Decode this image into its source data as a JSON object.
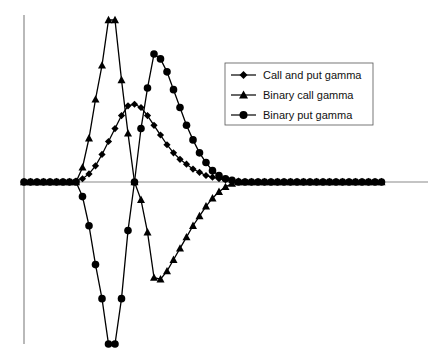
{
  "chart_data": {
    "type": "line",
    "title": "",
    "xlabel": "",
    "ylabel": "",
    "grid": false,
    "legend_position": "top-right",
    "ylim": [
      -100,
      100
    ],
    "x": [
      0,
      1,
      2,
      3,
      4,
      5,
      6,
      7,
      8,
      9,
      10,
      11,
      12,
      13,
      14,
      15,
      16,
      17,
      18,
      19,
      20,
      21,
      22,
      23,
      24,
      25,
      26,
      27,
      28,
      29,
      30,
      31,
      32,
      33,
      34,
      35,
      36,
      37,
      38,
      39,
      40,
      41,
      42,
      43,
      44,
      45,
      46,
      47,
      48,
      49,
      50,
      51,
      52,
      53,
      54,
      55
    ],
    "series": [
      {
        "name": "Call and put gamma",
        "marker": "diamond",
        "values": [
          0,
          0,
          0,
          0,
          0,
          0,
          0,
          0,
          0.5,
          2,
          5,
          10,
          17,
          25,
          33,
          41,
          47,
          48,
          46,
          41,
          35,
          29,
          23,
          18,
          14,
          11,
          8,
          6,
          4,
          3,
          2,
          1.5,
          1,
          0.5,
          0,
          0,
          0,
          0,
          0,
          0,
          0,
          0,
          0,
          0,
          0,
          0,
          0,
          0,
          0,
          0,
          0,
          0,
          0,
          0,
          0,
          0
        ]
      },
      {
        "name": "Binary call gamma",
        "marker": "triangle",
        "values": [
          0,
          0,
          0,
          0,
          0,
          0,
          0,
          0,
          0,
          9,
          27,
          51,
          72,
          100,
          100,
          63,
          30,
          0,
          -11,
          -31,
          -59,
          -60,
          -55,
          -48,
          -41,
          -34,
          -27,
          -21,
          -15,
          -10,
          -6,
          -3,
          -1,
          0,
          0,
          0,
          0,
          0,
          0,
          0,
          0,
          0,
          0,
          0,
          0,
          0,
          0,
          0,
          0,
          0,
          0,
          0,
          0,
          0,
          0,
          0
        ]
      },
      {
        "name": "Binary put gamma",
        "marker": "circle",
        "values": [
          0,
          0,
          0,
          0,
          0,
          0,
          0,
          0,
          0,
          -9,
          -27,
          -51,
          -72,
          -100,
          -100,
          -72,
          -30,
          0,
          33,
          58,
          79,
          76,
          68,
          57,
          46,
          35,
          26,
          18,
          12,
          7,
          4,
          2,
          1,
          0,
          0,
          0,
          0,
          0,
          0,
          0,
          0,
          0,
          0,
          0,
          0,
          0,
          0,
          0,
          0,
          0,
          0,
          0,
          0,
          0,
          0,
          0
        ]
      }
    ]
  }
}
